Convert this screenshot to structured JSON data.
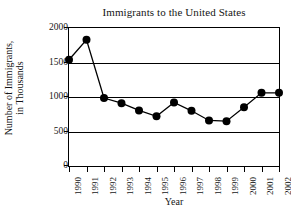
{
  "chart_data": {
    "type": "line",
    "title": "Immigrants to the United States",
    "xlabel": "Year",
    "ylabel": "Number of Immigrants, in Thousands",
    "ylabel_line1": "Number of Immigrants,",
    "ylabel_line2": "in Thousands",
    "categories": [
      "1990",
      "1991",
      "1992",
      "1993",
      "1994",
      "1995",
      "1996",
      "1997",
      "1998",
      "1999",
      "2000",
      "2001",
      "2002"
    ],
    "values": [
      1540,
      1830,
      985,
      910,
      805,
      720,
      920,
      800,
      660,
      650,
      850,
      1060,
      1060
    ],
    "ylim": [
      0,
      2000
    ],
    "yticks": [
      0,
      500,
      1000,
      1500,
      2000
    ],
    "ytick_labels": [
      "0",
      "500",
      "1000",
      "1500",
      "2000"
    ],
    "grid": true,
    "gridlines_at": [
      500,
      1000,
      1500,
      2000
    ],
    "legend": "none",
    "series_color": "#000000",
    "marker": "filled-circle"
  }
}
